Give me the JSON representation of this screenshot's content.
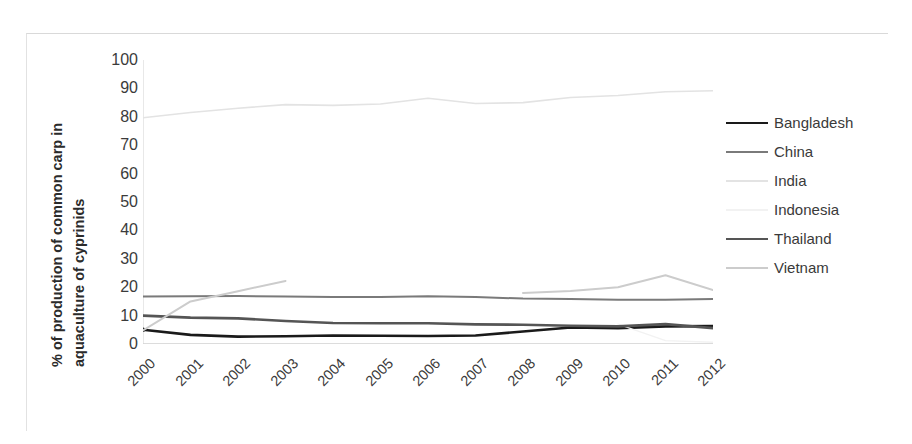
{
  "chart_data": {
    "type": "line",
    "title": "",
    "xlabel": "",
    "ylabel": "% of production of common carp in aquaculture of cyprinids",
    "ylabel_line1": "% of production of common carp in",
    "ylabel_line2": "aquaculture of cyprinids",
    "categories": [
      "2000",
      "2001",
      "2002",
      "2003",
      "2004",
      "2005",
      "2006",
      "2007",
      "2008",
      "2009",
      "2010",
      "2011",
      "2012"
    ],
    "x": [
      2000,
      2001,
      2002,
      2003,
      2004,
      2005,
      2006,
      2007,
      2008,
      2009,
      2010,
      2011,
      2012
    ],
    "ylim": [
      0,
      100
    ],
    "xlim": [
      2000,
      2012
    ],
    "yticks": [
      0,
      10,
      20,
      30,
      40,
      50,
      60,
      70,
      80,
      90,
      100
    ],
    "ytick_labels": [
      "0",
      "10",
      "20",
      "30",
      "40",
      "50",
      "60",
      "70",
      "80",
      "90",
      "100"
    ],
    "grid": false,
    "legend_position": "right",
    "series": [
      {
        "name": "Bangladesh",
        "color": "#1a1a1a",
        "width": 2.6,
        "marker": true,
        "values": [
          5.0,
          3.2,
          2.6,
          2.7,
          3.0,
          2.9,
          2.8,
          3.0,
          4.4,
          5.8,
          5.6,
          6.2,
          6.3
        ]
      },
      {
        "name": "China",
        "color": "#7a7a7a",
        "width": 2.0,
        "marker": false,
        "values": [
          16.7,
          16.8,
          16.9,
          16.7,
          16.6,
          16.6,
          16.8,
          16.6,
          16.0,
          15.8,
          15.6,
          15.6,
          15.8
        ]
      },
      {
        "name": "India",
        "color": "#e3e3e3",
        "width": 1.6,
        "marker": false,
        "values": [
          79.7,
          81.5,
          83.0,
          84.3,
          84.0,
          84.5,
          86.5,
          84.7,
          85.0,
          86.8,
          87.5,
          88.8,
          89.2
        ]
      },
      {
        "name": "Indonesia",
        "color": "#f2f2f2",
        "width": 1.4,
        "marker": false,
        "values": [
          null,
          null,
          null,
          null,
          null,
          null,
          null,
          null,
          null,
          null,
          7.0,
          1.2,
          0.6
        ]
      },
      {
        "name": "Thailand",
        "color": "#555555",
        "width": 2.6,
        "marker": false,
        "values": [
          10.0,
          9.3,
          9.0,
          8.1,
          7.4,
          7.3,
          7.3,
          6.9,
          6.8,
          6.4,
          6.2,
          7.0,
          5.6
        ]
      },
      {
        "name": "Vietnam",
        "color": "#cccccc",
        "width": 2.0,
        "marker": false,
        "values": [
          4.8,
          15.0,
          18.6,
          22.2,
          null,
          null,
          null,
          null,
          18.0,
          18.7,
          20.0,
          24.2,
          19.0
        ]
      }
    ]
  },
  "legend": {
    "items": [
      {
        "label": "Bangladesh"
      },
      {
        "label": "China"
      },
      {
        "label": "India"
      },
      {
        "label": "Indonesia"
      },
      {
        "label": "Thailand"
      },
      {
        "label": "Vietnam"
      }
    ]
  }
}
